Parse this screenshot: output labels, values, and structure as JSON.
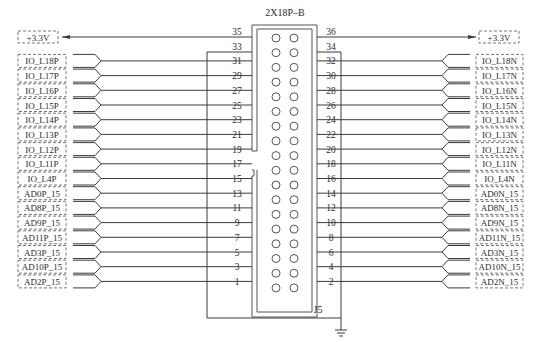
{
  "connector": {
    "part_name": "2X18P–B",
    "ref_des": "J5",
    "rows": [
      {
        "left_pin": "35",
        "right_pin": "36"
      },
      {
        "left_pin": "33",
        "right_pin": "34"
      },
      {
        "left_pin": "31",
        "right_pin": "32"
      },
      {
        "left_pin": "29",
        "right_pin": "30"
      },
      {
        "left_pin": "27",
        "right_pin": "28"
      },
      {
        "left_pin": "25",
        "right_pin": "26"
      },
      {
        "left_pin": "23",
        "right_pin": "24"
      },
      {
        "left_pin": "21",
        "right_pin": "22"
      },
      {
        "left_pin": "19",
        "right_pin": "20"
      },
      {
        "left_pin": "17",
        "right_pin": "18"
      },
      {
        "left_pin": "15",
        "right_pin": "16"
      },
      {
        "left_pin": "13",
        "right_pin": "14"
      },
      {
        "left_pin": "11",
        "right_pin": "12"
      },
      {
        "left_pin": "9",
        "right_pin": "10"
      },
      {
        "left_pin": "7",
        "right_pin": "8"
      },
      {
        "left_pin": "5",
        "right_pin": "6"
      },
      {
        "left_pin": "3",
        "right_pin": "4"
      },
      {
        "left_pin": "1",
        "right_pin": "2"
      }
    ]
  },
  "power": {
    "left_label": "+3.3V",
    "right_label": "+3.3V"
  },
  "ground": {
    "symbol": "ground-icon"
  },
  "left_nets": [
    {
      "pin": "31",
      "label": "IO_L18P"
    },
    {
      "pin": "29",
      "label": "IO_L17P"
    },
    {
      "pin": "27",
      "label": "IO_L16P"
    },
    {
      "pin": "25",
      "label": "IO_L15P"
    },
    {
      "pin": "23",
      "label": "IO_L14P"
    },
    {
      "pin": "21",
      "label": "IO_L13P"
    },
    {
      "pin": "19",
      "label": "IO_L12P"
    },
    {
      "pin": "17",
      "label": "IO_L11P"
    },
    {
      "pin": "15",
      "label": "IO_L4P"
    },
    {
      "pin": "13",
      "label": "AD0P_15"
    },
    {
      "pin": "11",
      "label": "AD8P_15"
    },
    {
      "pin": "9",
      "label": "AD9P_15"
    },
    {
      "pin": "7",
      "label": "AD11P_15"
    },
    {
      "pin": "5",
      "label": "AD3P_15"
    },
    {
      "pin": "3",
      "label": "AD10P_15"
    },
    {
      "pin": "1",
      "label": "AD2P_15"
    }
  ],
  "right_nets": [
    {
      "pin": "32",
      "label": "IO_L18N"
    },
    {
      "pin": "30",
      "label": "IO_L17N"
    },
    {
      "pin": "28",
      "label": "IO_L16N"
    },
    {
      "pin": "26",
      "label": "IO_L15N"
    },
    {
      "pin": "24",
      "label": "IO_L14N"
    },
    {
      "pin": "22",
      "label": "IO_L13N"
    },
    {
      "pin": "20",
      "label": "IO_L12N"
    },
    {
      "pin": "18",
      "label": "IO_L11N"
    },
    {
      "pin": "16",
      "label": "IO_L4N"
    },
    {
      "pin": "14",
      "label": "AD0N_15"
    },
    {
      "pin": "12",
      "label": "AD8N_15"
    },
    {
      "pin": "10",
      "label": "AD9N_15"
    },
    {
      "pin": "8",
      "label": "AD11N_15"
    },
    {
      "pin": "6",
      "label": "AD3N_15"
    },
    {
      "pin": "4",
      "label": "AD10N_15"
    },
    {
      "pin": "2",
      "label": "AD2N_15"
    }
  ],
  "colors": {
    "line": "#3a3a3a",
    "background": "#ffffff"
  }
}
